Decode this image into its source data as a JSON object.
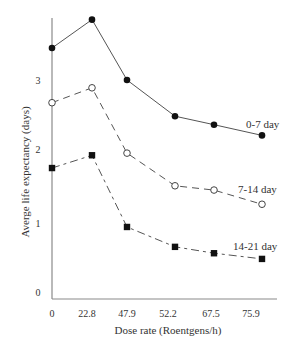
{
  "chart_data": {
    "type": "line",
    "title": "",
    "xlabel": "Dose rate (Roentgens/h)",
    "ylabel": "Averge life expectancy (days)",
    "categories": [
      "0",
      "22.8",
      "47.9",
      "52.2",
      "67.5",
      "75.9"
    ],
    "yticks": [
      "0",
      "1",
      "2",
      "3"
    ],
    "ylim": [
      0,
      4
    ],
    "grid": false,
    "legend_position": "inline labels at right end of each line",
    "series": [
      {
        "name": "0-7 day",
        "marker": "filled-circle",
        "line": "solid",
        "values": [
          3.45,
          3.85,
          3.0,
          2.49,
          2.37,
          2.22
        ]
      },
      {
        "name": "7-14 day",
        "marker": "open-circle",
        "line": "dashed",
        "values": [
          2.68,
          2.89,
          1.97,
          1.51,
          1.45,
          1.25
        ]
      },
      {
        "name": "14-21 day",
        "marker": "filled-square",
        "line": "dash-dot",
        "values": [
          1.76,
          1.94,
          0.93,
          0.65,
          0.56,
          0.48
        ]
      }
    ]
  },
  "colors": {
    "axis": "#8a8a8a",
    "line": "#555555",
    "marker": "#111111",
    "text": "#333333"
  }
}
